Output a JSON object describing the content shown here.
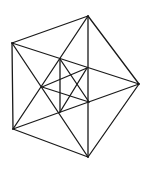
{
  "diagram": {
    "type": "hand-drawn geometric figure",
    "stroke_color": "#1a1a1a",
    "background": "#ffffff",
    "vertices": {
      "top": [
        88,
        16
      ],
      "upper_left": [
        12,
        43
      ],
      "right": [
        139,
        84
      ],
      "lower_left": [
        13,
        129
      ],
      "bottom": [
        88,
        157
      ],
      "inner_top": [
        60,
        59
      ],
      "inner_upper_right": [
        87,
        68
      ],
      "inner_left": [
        42,
        87
      ],
      "inner_lower_right": [
        89,
        102
      ],
      "inner_bottom": [
        60,
        112
      ]
    },
    "edges": [
      [
        "top",
        "right"
      ],
      [
        "right",
        "bottom"
      ],
      [
        "bottom",
        "lower_left"
      ],
      [
        "lower_left",
        "upper_left"
      ],
      [
        "upper_left",
        "top"
      ],
      [
        "top",
        "bottom"
      ],
      [
        "upper_left",
        "right"
      ],
      [
        "lower_left",
        "right"
      ],
      [
        "top",
        "lower_left"
      ],
      [
        "bottom",
        "upper_left"
      ],
      [
        "inner_top",
        "inner_bottom"
      ],
      [
        "inner_left",
        "inner_upper_right"
      ],
      [
        "inner_left",
        "inner_lower_right"
      ],
      [
        "inner_top",
        "inner_lower_right"
      ],
      [
        "inner_bottom",
        "inner_upper_right"
      ]
    ]
  }
}
